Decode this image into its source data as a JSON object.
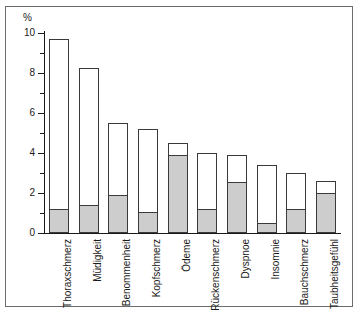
{
  "chart_data": {
    "type": "bar",
    "subtype": "stacked",
    "title": "",
    "xlabel": "",
    "ylabel": "%",
    "ylim": [
      0,
      10
    ],
    "ytick_step": 2,
    "yminor_step": 1,
    "grid": false,
    "legend": "none",
    "categories": [
      "Thoraxschmerz",
      "Müdigkeit",
      "Benommenheit",
      "Kopfschmerz",
      "Ödeme",
      "Rückenschmerz",
      "Dyspnoe",
      "Insomnie",
      "Bauchschmerz",
      "Taubheitsgefühl"
    ],
    "ytick_labels": [
      "0",
      "2",
      "4",
      "6",
      "8",
      "10"
    ],
    "ytick_values": [
      0,
      2,
      4,
      6,
      8,
      10
    ],
    "series": [
      {
        "name": "lower-segment",
        "fill": "#cdcdcd",
        "values": [
          1.2,
          1.4,
          1.9,
          1.05,
          3.9,
          1.2,
          2.55,
          0.5,
          1.2,
          2.0
        ]
      },
      {
        "name": "total",
        "fill": "#ffffff",
        "values": [
          9.7,
          8.25,
          5.5,
          5.2,
          4.5,
          4.0,
          3.9,
          3.4,
          3.0,
          2.6
        ]
      }
    ]
  },
  "colors": {
    "axis": "#1a1a1a",
    "bar_outline": "#3a3a3a",
    "bar_lower_fill": "#cdcdcd",
    "bar_upper_fill": "#ffffff",
    "frame": "#6b6b6b",
    "background": "#ffffff"
  }
}
